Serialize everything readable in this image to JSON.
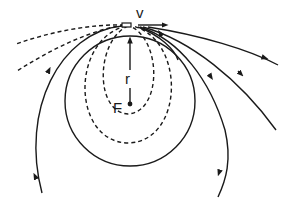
{
  "diagram": {
    "type": "orbit-trajectories",
    "labels": {
      "velocity": "v",
      "radius": "r",
      "focus": "F"
    },
    "colors": {
      "stroke": "#1a1a1a",
      "background": "#ffffff"
    },
    "elements": {
      "launch_point": "small rectangle at top center",
      "dashed_orbits": 4,
      "solid_orbits": 6,
      "circular_orbit": 1
    }
  }
}
